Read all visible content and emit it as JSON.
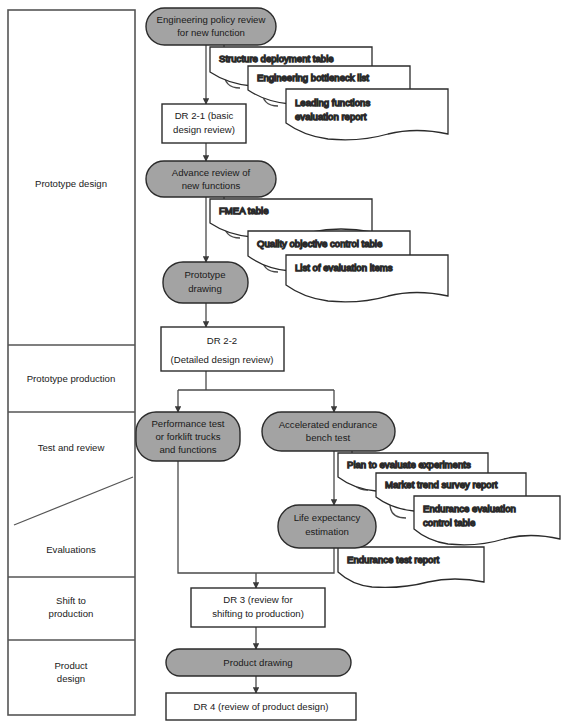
{
  "diagram": {
    "colors": {
      "process_fill": "#a3a3a3",
      "process_stroke": "#2b2b2b",
      "box_fill": "#ffffff",
      "box_stroke": "#2b2b2b",
      "doc_fill": "#ffffff",
      "doc_stroke": "#2b2b2b",
      "connector": "#4a4a4a",
      "phase_stroke": "#555555",
      "text": "#1a1a1a"
    },
    "phases": [
      {
        "id": "prototype-design",
        "label": "Prototype design"
      },
      {
        "id": "prototype-production",
        "label": "Prototype production"
      },
      {
        "id": "test-and-review",
        "label": "Test and review"
      },
      {
        "id": "evaluations",
        "label": "Evaluations"
      },
      {
        "id": "shift-to-production",
        "label": "Shift to\nproduction",
        "line1": "Shift to",
        "line2": "production"
      },
      {
        "id": "product-design",
        "label": "Product\ndesign",
        "line1": "Product",
        "line2": "design"
      }
    ],
    "nodes": [
      {
        "id": "engineering-policy-review",
        "shape": "rounded",
        "line1": "Engineering policy review",
        "line2": "for new function"
      },
      {
        "id": "dr-2-1",
        "shape": "box",
        "line1": "DR 2-1 (basic",
        "line2": "design review)"
      },
      {
        "id": "advance-review",
        "shape": "rounded",
        "line1": "Advance review of",
        "line2": "new functions"
      },
      {
        "id": "prototype-drawing",
        "shape": "rounded",
        "line1": "Prototype",
        "line2": "drawing"
      },
      {
        "id": "dr-2-2",
        "shape": "box",
        "line1": "DR 2-2",
        "line2": "(Detailed design review)"
      },
      {
        "id": "performance-test",
        "shape": "rounded",
        "line1": "Performance test",
        "line2": "or forklift trucks",
        "line3": "and functions"
      },
      {
        "id": "accelerated-endurance",
        "shape": "rounded",
        "line1": "Accelerated endurance",
        "line2": "bench test"
      },
      {
        "id": "life-expectancy",
        "shape": "rounded",
        "line1": "Life expectancy",
        "line2": "estimation"
      },
      {
        "id": "dr-3",
        "shape": "box",
        "line1": "DR 3 (review for",
        "line2": "shifting to production)"
      },
      {
        "id": "product-drawing",
        "shape": "rounded",
        "line1": "Product drawing",
        "line2": ""
      },
      {
        "id": "dr-4",
        "shape": "box",
        "line1": "DR 4 (review of product design)",
        "line2": ""
      }
    ],
    "documents": [
      {
        "id": "structure-deployment-table",
        "line1": "Structure deployment table",
        "line2": ""
      },
      {
        "id": "engineering-bottleneck-list",
        "line1": "Engineering bottleneck list",
        "line2": ""
      },
      {
        "id": "leading-functions-evaluation-report",
        "line1": "Leading functions",
        "line2": "evaluation report"
      },
      {
        "id": "fmea-table",
        "line1": "FMEA table",
        "line2": ""
      },
      {
        "id": "quality-objective-control-table",
        "line1": "Quality objective control table",
        "line2": ""
      },
      {
        "id": "list-of-evaluation-items",
        "line1": "List of evaluation items",
        "line2": ""
      },
      {
        "id": "plan-to-evaluate-experiments",
        "line1": "Plan to evaluate experiments",
        "line2": ""
      },
      {
        "id": "market-trend-survey-report",
        "line1": "Market trend survey report",
        "line2": ""
      },
      {
        "id": "endurance-evaluation-control-table",
        "line1": "Endurance evaluation",
        "line2": "control table"
      },
      {
        "id": "endurance-test-report",
        "line1": "Endurance test report",
        "line2": ""
      }
    ]
  }
}
